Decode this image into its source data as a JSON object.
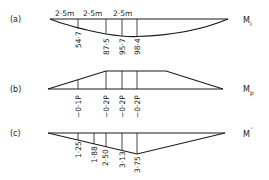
{
  "panels": [
    {
      "id": "a",
      "label": "(a)",
      "moment_label": "M",
      "moment_sub": "i",
      "spans": [
        "2·5m",
        "2·5m",
        "2·5m"
      ],
      "ordinates": [
        "54·7",
        "87·5",
        "95·7",
        "98·4"
      ]
    },
    {
      "id": "b",
      "label": "(b)",
      "moment_label": "M",
      "moment_sub": "p",
      "ordinates": [
        "−0·1P",
        "−0·2P",
        "−0·2P",
        "−0·2P"
      ]
    },
    {
      "id": "c",
      "label": "(c)",
      "moment_label": "M",
      "moment_sub": "´",
      "ordinates": [
        "1·25",
        "1·88",
        "2·50",
        "3·13",
        "3·75"
      ]
    }
  ],
  "colors": {
    "line": "#1a1a1a",
    "background": "#ffffff"
  }
}
